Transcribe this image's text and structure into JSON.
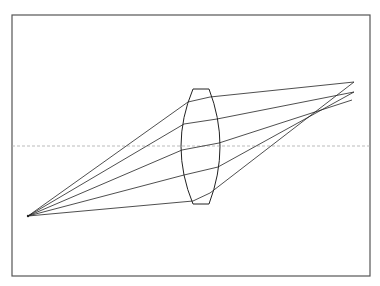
{
  "diagram": {
    "type": "ray-optics",
    "frame": {
      "x": 12,
      "y": 15,
      "width": 358,
      "height": 261,
      "stroke": "#555555"
    },
    "optical_axis": {
      "y": 146,
      "x1": 12,
      "x2": 370,
      "stroke": "#aaaaaa",
      "dash": "3,2"
    },
    "source_point": {
      "x": 28,
      "y": 216
    },
    "lens": {
      "top_flat": {
        "x1": 193,
        "x2": 209,
        "y": 89
      },
      "bottom_flat": {
        "x1": 193,
        "x2": 209,
        "y": 204
      },
      "left_bulge_x": 181,
      "right_bulge_x": 220,
      "center_y": 146,
      "stroke": "#222222"
    },
    "rays": [
      {
        "entry": [
          188,
          102
        ],
        "exit": [
          210,
          97
        ],
        "end": [
          354,
          82
        ]
      },
      {
        "entry": [
          184,
          124
        ],
        "exit": [
          217,
          119
        ],
        "end": [
          354,
          92
        ]
      },
      {
        "entry": [
          182,
          150
        ],
        "exit": [
          219,
          143
        ],
        "end": [
          352,
          100
        ]
      },
      {
        "entry": [
          184,
          175
        ],
        "exit": [
          218,
          167
        ],
        "end": [
          354,
          92
        ]
      },
      {
        "entry": [
          193,
          201
        ],
        "exit": [
          210,
          193
        ],
        "end": [
          354,
          82
        ]
      }
    ],
    "ray_stroke": "#222222"
  }
}
